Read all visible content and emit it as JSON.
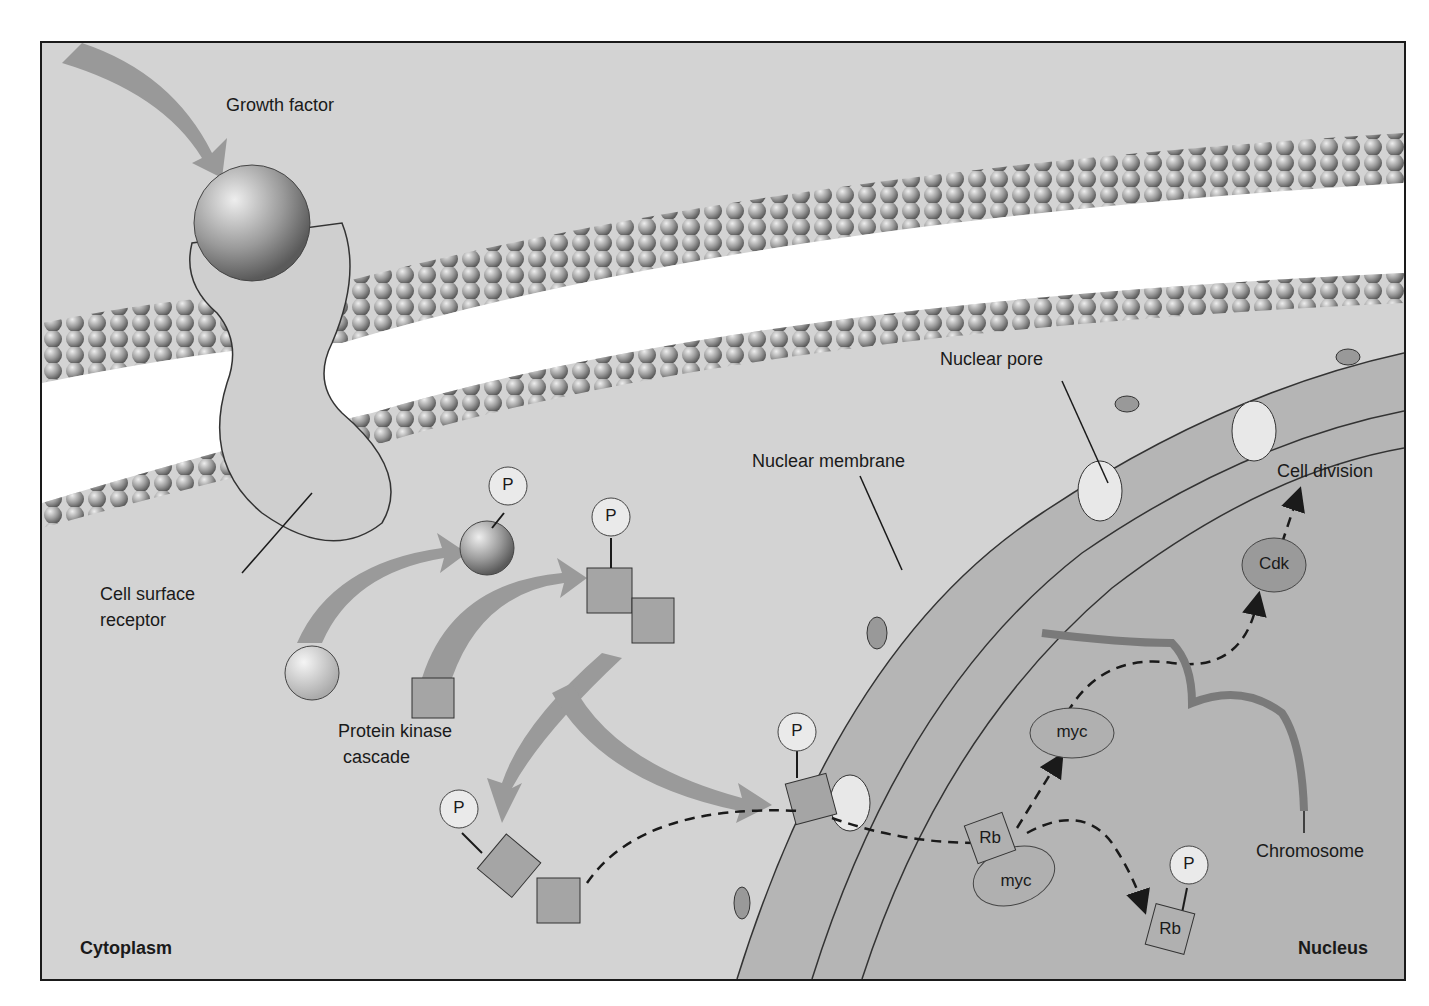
{
  "diagram": {
    "labels": {
      "growth_factor": "Growth factor",
      "cell_surface_receptor_line1": "Cell surface",
      "cell_surface_receptor_line2": "receptor",
      "protein_kinase_line1": "Protein kinase",
      "protein_kinase_line2": "cascade",
      "nuclear_membrane": "Nuclear membrane",
      "nuclear_pore": "Nuclear pore",
      "cell_division": "Cell division",
      "chromosome": "Chromosome",
      "cytoplasm": "Cytoplasm",
      "nucleus": "Nucleus"
    },
    "molecules": {
      "phosphate": "P",
      "cdk": "Cdk",
      "myc_free": "myc",
      "myc_bound": "myc",
      "rb_bound": "Rb",
      "rb_phosphorylated": "Rb"
    },
    "nodes": [
      {
        "id": "growth-factor",
        "label": "Growth factor"
      },
      {
        "id": "receptor",
        "label": "Cell surface receptor"
      },
      {
        "id": "kinase-cascade",
        "label": "Protein kinase cascade"
      },
      {
        "id": "rb-myc-complex",
        "label": "Rb + myc"
      },
      {
        "id": "myc",
        "label": "myc"
      },
      {
        "id": "rb-p",
        "label": "Rb + P"
      },
      {
        "id": "cdk",
        "label": "Cdk"
      },
      {
        "id": "cell-division",
        "label": "Cell division"
      }
    ],
    "edges": [
      {
        "from": "growth-factor",
        "to": "receptor"
      },
      {
        "from": "receptor",
        "to": "kinase-cascade"
      },
      {
        "from": "kinase-cascade",
        "to": "rb-myc-complex"
      },
      {
        "from": "rb-myc-complex",
        "to": "myc"
      },
      {
        "from": "rb-myc-complex",
        "to": "rb-p"
      },
      {
        "from": "myc",
        "to": "cdk"
      },
      {
        "from": "cdk",
        "to": "cell-division"
      }
    ],
    "colors": {
      "background": "#d3d3d3",
      "membrane_head": "#8a8a8a",
      "arrow": "#9a9a9a",
      "nucleus_fill": "#bdbdbd",
      "border": "#1a1a1a"
    }
  }
}
